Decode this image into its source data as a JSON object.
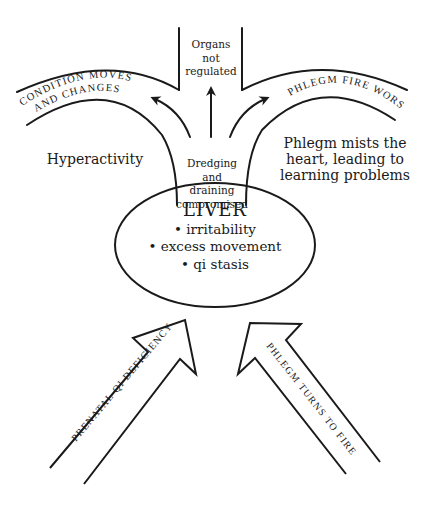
{
  "diagram": {
    "center_node": {
      "title": "LIVER",
      "items": [
        "• irritability",
        "• excess movement",
        "• qi stasis"
      ]
    },
    "stem_label": [
      "Dredging",
      "and",
      "draining",
      "compromised"
    ],
    "top_center_label": [
      "Organs",
      "not",
      "regulated"
    ],
    "left_branch": {
      "channel_text_line1": "CONDITION MOVES",
      "channel_text_line2": "AND CHANGES",
      "outcome": "Hyperactivity"
    },
    "right_branch": {
      "channel_text": "PHLEGM FIRE WORSENS",
      "outcome": [
        "Phlegm mists the",
        "heart, leading to",
        "learning problems"
      ]
    },
    "input_arrows": [
      {
        "label": "PRENATAL QI DEFICIENCY",
        "direction": "up-right"
      },
      {
        "label": "PHLEGM TURNS TO FIRE",
        "direction": "up-left"
      }
    ],
    "colors": {
      "line": "#1a1a1a",
      "background": "#ffffff"
    }
  }
}
